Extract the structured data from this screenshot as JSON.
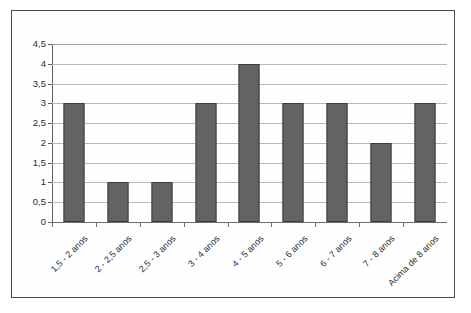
{
  "chart_data": {
    "type": "bar",
    "title": "",
    "subtitle": "",
    "xlabel": "",
    "ylabel": "",
    "categories": [
      "1,5 - 2 anos",
      "2 - 2,5 anos",
      "2,5 - 3 anos",
      "3 - 4 anos",
      "4 - 5 anos",
      "5 - 6 anos",
      "6 - 7 anos",
      "7 - 8 anos",
      "Acima de 8 anos"
    ],
    "values": [
      3,
      1,
      1,
      3,
      4,
      3,
      3,
      2,
      3
    ],
    "ylim": [
      0,
      4.5
    ],
    "ytick_labels": [
      "0",
      "0,5",
      "1",
      "1,5",
      "2",
      "2,5",
      "3",
      "3,5",
      "4",
      "4,5"
    ],
    "ytick_values": [
      0,
      0.5,
      1,
      1.5,
      2,
      2.5,
      3,
      3.5,
      4,
      4.5
    ],
    "grid": true,
    "legend": false,
    "legend_position": "none",
    "series": [
      {
        "name": "",
        "values": [
          3,
          1,
          1,
          3,
          4,
          3,
          3,
          2,
          3
        ]
      }
    ],
    "colors": {
      "bar_fill": "#636363",
      "bar_stroke": "#3c3c3c",
      "gridline": "#b9b9b9",
      "axis": "#5e5e5e",
      "baseline": "#6d6d6d",
      "text": "#2f2f2f",
      "plot_background": "#ffffff",
      "page_background": "#fefefe",
      "frame": "#4a4a4a"
    }
  }
}
